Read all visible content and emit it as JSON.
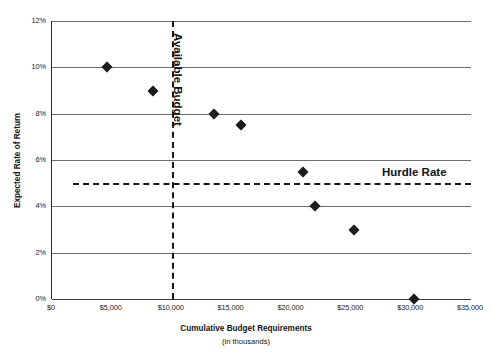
{
  "chart_data": {
    "type": "scatter",
    "title": "",
    "xlabel": "Cumulative Budget Requirements",
    "xsublabel": "(in thousands)",
    "ylabel": "Expected Rate of Return",
    "xlim": [
      0,
      35000
    ],
    "ylim": [
      0,
      12
    ],
    "grid": true,
    "legend": "none",
    "xticks": [
      "$0",
      "$5,000",
      "$10,000",
      "$15,000",
      "$20,000",
      "$25,000",
      "$30,000",
      "$35,000"
    ],
    "xtick_values": [
      0,
      5000,
      10000,
      15000,
      20000,
      25000,
      30000,
      35000
    ],
    "yticks": [
      "0%",
      "2%",
      "4%",
      "6%",
      "8%",
      "10%",
      "12%"
    ],
    "ytick_values": [
      0,
      2,
      4,
      6,
      8,
      10,
      12
    ],
    "series": [
      {
        "name": "Projects",
        "marker": "diamond",
        "color": "#1c1c1c",
        "points": [
          {
            "x": 4600,
            "y": 10.0
          },
          {
            "x": 8400,
            "y": 9.0
          },
          {
            "x": 13500,
            "y": 8.0
          },
          {
            "x": 15800,
            "y": 7.5
          },
          {
            "x": 21000,
            "y": 5.5
          },
          {
            "x": 22000,
            "y": 4.0
          },
          {
            "x": 25200,
            "y": 3.0
          },
          {
            "x": 30200,
            "y": 0.0
          }
        ]
      }
    ],
    "annotations": [
      {
        "name": "available-budget",
        "label": "Available Budget",
        "orientation": "vertical",
        "value": 10000,
        "style": "dashed",
        "color": "#171717"
      },
      {
        "name": "hurdle-rate",
        "label": "Hurdle Rate",
        "orientation": "horizontal",
        "value": 5.0,
        "style": "dashed",
        "color": "#171717"
      }
    ]
  }
}
